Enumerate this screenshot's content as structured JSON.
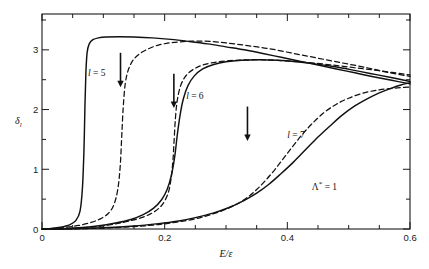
{
  "chart_data": {
    "type": "line",
    "title": "",
    "xlabel": "E/ε",
    "ylabel": "δₗ",
    "xlim": [
      0,
      0.6
    ],
    "ylim": [
      0,
      3.6
    ],
    "grid": false,
    "legend_position": "inline-curve-labels",
    "x_ticks_major": [
      0,
      0.2,
      0.4,
      0.6
    ],
    "x_tick_labels": [
      "0",
      "0.2",
      "0.4",
      "0.6"
    ],
    "x_tick_minor_step": 0.05,
    "y_ticks_major": [
      0,
      1,
      2,
      3
    ],
    "y_tick_labels": [
      "0",
      "1",
      "2",
      "3"
    ],
    "y_tick_minor_step": 0.5,
    "annotations": [
      {
        "text": "Λ* = 1",
        "x": 0.44,
        "y": 0.72
      },
      {
        "text": "l = 5",
        "x": 0.075,
        "y": 2.62
      },
      {
        "text": "l = 6",
        "x": 0.235,
        "y": 2.23
      },
      {
        "text": "l = 7",
        "x": 0.4,
        "y": 1.57
      }
    ],
    "resonance_arrows": [
      {
        "label": "l = 5",
        "x": 0.128,
        "y_top": 2.95,
        "y_tip": 2.4
      },
      {
        "label": "l = 6",
        "x": 0.215,
        "y_top": 2.6,
        "y_tip": 2.05
      },
      {
        "label": "l = 7",
        "x": 0.335,
        "y_top": 2.05,
        "y_tip": 1.5
      }
    ],
    "series": [
      {
        "name": "l = 5 solid",
        "style": "solid",
        "points": [
          [
            0.0,
            0.0
          ],
          [
            0.015,
            0.01
          ],
          [
            0.03,
            0.03
          ],
          [
            0.045,
            0.07
          ],
          [
            0.055,
            0.14
          ],
          [
            0.062,
            0.3
          ],
          [
            0.066,
            0.7
          ],
          [
            0.0685,
            1.35
          ],
          [
            0.07,
            2.05
          ],
          [
            0.0715,
            2.6
          ],
          [
            0.0735,
            2.95
          ],
          [
            0.077,
            3.1
          ],
          [
            0.083,
            3.17
          ],
          [
            0.092,
            3.2
          ],
          [
            0.105,
            3.215
          ],
          [
            0.125,
            3.22
          ],
          [
            0.15,
            3.215
          ],
          [
            0.18,
            3.2
          ],
          [
            0.21,
            3.175
          ],
          [
            0.24,
            3.14
          ],
          [
            0.27,
            3.1
          ],
          [
            0.3,
            3.05
          ],
          [
            0.33,
            3.0
          ],
          [
            0.36,
            2.94
          ],
          [
            0.39,
            2.875
          ],
          [
            0.42,
            2.81
          ],
          [
            0.45,
            2.745
          ],
          [
            0.48,
            2.68
          ],
          [
            0.51,
            2.615
          ],
          [
            0.54,
            2.55
          ],
          [
            0.57,
            2.49
          ],
          [
            0.6,
            2.43
          ]
        ]
      },
      {
        "name": "l = 5 dashed",
        "style": "dashed",
        "points": [
          [
            0.0,
            0.0
          ],
          [
            0.02,
            0.01
          ],
          [
            0.04,
            0.03
          ],
          [
            0.06,
            0.06
          ],
          [
            0.08,
            0.11
          ],
          [
            0.095,
            0.17
          ],
          [
            0.108,
            0.26
          ],
          [
            0.117,
            0.4
          ],
          [
            0.1235,
            0.66
          ],
          [
            0.1275,
            1.05
          ],
          [
            0.13,
            1.55
          ],
          [
            0.1325,
            2.05
          ],
          [
            0.136,
            2.45
          ],
          [
            0.142,
            2.7
          ],
          [
            0.152,
            2.87
          ],
          [
            0.168,
            2.99
          ],
          [
            0.19,
            3.08
          ],
          [
            0.215,
            3.125
          ],
          [
            0.245,
            3.145
          ],
          [
            0.275,
            3.14
          ],
          [
            0.305,
            3.11
          ],
          [
            0.335,
            3.07
          ],
          [
            0.37,
            3.02
          ],
          [
            0.41,
            2.94
          ],
          [
            0.45,
            2.86
          ],
          [
            0.49,
            2.78
          ],
          [
            0.53,
            2.7
          ],
          [
            0.565,
            2.62
          ],
          [
            0.6,
            2.555
          ]
        ]
      },
      {
        "name": "l = 6 solid",
        "style": "solid",
        "points": [
          [
            0.0,
            0.0
          ],
          [
            0.03,
            0.005
          ],
          [
            0.06,
            0.02
          ],
          [
            0.09,
            0.05
          ],
          [
            0.12,
            0.1
          ],
          [
            0.145,
            0.16
          ],
          [
            0.165,
            0.24
          ],
          [
            0.182,
            0.35
          ],
          [
            0.195,
            0.49
          ],
          [
            0.204,
            0.66
          ],
          [
            0.211,
            0.9
          ],
          [
            0.2165,
            1.22
          ],
          [
            0.2205,
            1.57
          ],
          [
            0.225,
            1.9
          ],
          [
            0.2305,
            2.18
          ],
          [
            0.238,
            2.4
          ],
          [
            0.248,
            2.56
          ],
          [
            0.262,
            2.68
          ],
          [
            0.28,
            2.755
          ],
          [
            0.3,
            2.8
          ],
          [
            0.325,
            2.825
          ],
          [
            0.355,
            2.835
          ],
          [
            0.385,
            2.825
          ],
          [
            0.415,
            2.8
          ],
          [
            0.445,
            2.765
          ],
          [
            0.475,
            2.72
          ],
          [
            0.505,
            2.665
          ],
          [
            0.535,
            2.605
          ],
          [
            0.565,
            2.545
          ],
          [
            0.6,
            2.47
          ]
        ]
      },
      {
        "name": "l = 6 dashed",
        "style": "dashed",
        "points": [
          [
            0.0,
            0.0
          ],
          [
            0.03,
            0.004
          ],
          [
            0.06,
            0.015
          ],
          [
            0.09,
            0.04
          ],
          [
            0.12,
            0.085
          ],
          [
            0.145,
            0.14
          ],
          [
            0.165,
            0.2
          ],
          [
            0.18,
            0.27
          ],
          [
            0.192,
            0.36
          ],
          [
            0.2,
            0.47
          ],
          [
            0.2065,
            0.63
          ],
          [
            0.2105,
            0.85
          ],
          [
            0.2135,
            1.15
          ],
          [
            0.2155,
            1.5
          ],
          [
            0.2175,
            1.85
          ],
          [
            0.2205,
            2.15
          ],
          [
            0.226,
            2.4
          ],
          [
            0.235,
            2.57
          ],
          [
            0.248,
            2.68
          ],
          [
            0.265,
            2.755
          ],
          [
            0.288,
            2.8
          ],
          [
            0.315,
            2.825
          ],
          [
            0.35,
            2.835
          ],
          [
            0.39,
            2.82
          ],
          [
            0.43,
            2.79
          ],
          [
            0.47,
            2.75
          ],
          [
            0.51,
            2.7
          ],
          [
            0.55,
            2.65
          ],
          [
            0.6,
            2.58
          ]
        ]
      },
      {
        "name": "l = 7 solid",
        "style": "solid",
        "points": [
          [
            0.0,
            0.0
          ],
          [
            0.05,
            0.004
          ],
          [
            0.1,
            0.02
          ],
          [
            0.15,
            0.05
          ],
          [
            0.19,
            0.09
          ],
          [
            0.22,
            0.13
          ],
          [
            0.25,
            0.19
          ],
          [
            0.28,
            0.27
          ],
          [
            0.305,
            0.36
          ],
          [
            0.33,
            0.48
          ],
          [
            0.35,
            0.6
          ],
          [
            0.37,
            0.75
          ],
          [
            0.39,
            0.93
          ],
          [
            0.41,
            1.12
          ],
          [
            0.43,
            1.33
          ],
          [
            0.45,
            1.54
          ],
          [
            0.47,
            1.73
          ],
          [
            0.49,
            1.91
          ],
          [
            0.51,
            2.06
          ],
          [
            0.53,
            2.18
          ],
          [
            0.55,
            2.28
          ],
          [
            0.57,
            2.36
          ],
          [
            0.585,
            2.41
          ],
          [
            0.6,
            2.45
          ]
        ]
      },
      {
        "name": "l = 7 dashed",
        "style": "dashed",
        "points": [
          [
            0.0,
            0.0
          ],
          [
            0.05,
            0.003
          ],
          [
            0.1,
            0.015
          ],
          [
            0.15,
            0.04
          ],
          [
            0.19,
            0.075
          ],
          [
            0.22,
            0.115
          ],
          [
            0.25,
            0.17
          ],
          [
            0.275,
            0.24
          ],
          [
            0.3,
            0.33
          ],
          [
            0.32,
            0.43
          ],
          [
            0.335,
            0.53
          ],
          [
            0.35,
            0.66
          ],
          [
            0.365,
            0.82
          ],
          [
            0.38,
            1.0
          ],
          [
            0.395,
            1.2
          ],
          [
            0.41,
            1.4
          ],
          [
            0.425,
            1.59
          ],
          [
            0.44,
            1.76
          ],
          [
            0.46,
            1.95
          ],
          [
            0.48,
            2.09
          ],
          [
            0.5,
            2.19
          ],
          [
            0.525,
            2.28
          ],
          [
            0.55,
            2.33
          ],
          [
            0.575,
            2.36
          ],
          [
            0.6,
            2.375
          ]
        ]
      }
    ]
  },
  "figure": {
    "xlabel": "E/ε",
    "ylabel_symbol": "δ",
    "ylabel_sub": "l",
    "annotation_lambda": "Λ",
    "annotation_lambda_rest": " = 1",
    "annotation_lambda_sup": "*",
    "label_l5_var": "l",
    "label_l5_rest": " = 5",
    "label_l6_var": "l",
    "label_l6_rest": " = 6",
    "label_l7_var": "l",
    "label_l7_rest": " = 7",
    "x_tick_0": "0",
    "x_tick_1": "0.2",
    "x_tick_2": "0.4",
    "x_tick_3": "0.6",
    "y_tick_0": "0",
    "y_tick_1": "1",
    "y_tick_2": "2",
    "y_tick_3": "3"
  },
  "colors": {
    "axis": "#1a1a1a",
    "curve": "#111111",
    "background": "#ffffff"
  }
}
